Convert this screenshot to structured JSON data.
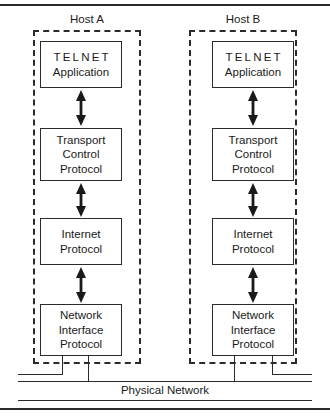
{
  "diagram": {
    "colors": {
      "ink": "#2b2b2b",
      "text": "#1a1a1a",
      "background": "#ffffff"
    },
    "hosts": [
      {
        "label": "Host A",
        "layers": [
          {
            "lines": [
              "TELNET",
              "Application"
            ]
          },
          {
            "lines": [
              "Transport",
              "Control",
              "Protocol"
            ]
          },
          {
            "lines": [
              "Internet",
              "Protocol"
            ]
          },
          {
            "lines": [
              "Network",
              "Interface",
              "Protocol"
            ]
          }
        ]
      },
      {
        "label": "Host B",
        "layers": [
          {
            "lines": [
              "TELNET",
              "Application"
            ]
          },
          {
            "lines": [
              "Transport",
              "Control",
              "Protocol"
            ]
          },
          {
            "lines": [
              "Internet",
              "Protocol"
            ]
          },
          {
            "lines": [
              "Network",
              "Interface",
              "Protocol"
            ]
          }
        ]
      }
    ],
    "network": {
      "label": "Physical Network"
    }
  }
}
